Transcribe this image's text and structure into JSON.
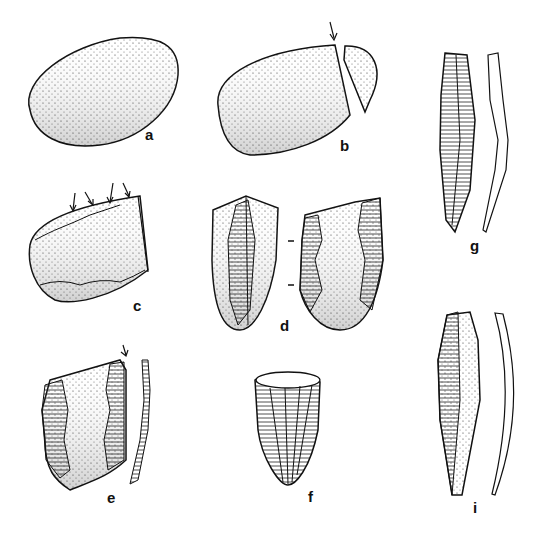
{
  "figure": {
    "items": [
      {
        "id": "a",
        "label": "a",
        "description": "ovoid pebble / nodule"
      },
      {
        "id": "b",
        "label": "b",
        "description": "nodule with struck-off end, arrow marking blow"
      },
      {
        "id": "c",
        "label": "c",
        "description": "core with retouched edge, four arrows"
      },
      {
        "id": "d",
        "label": "d",
        "description": "two views of a bifacially flaked piece"
      },
      {
        "id": "e",
        "label": "e",
        "description": "retouched piece with side profile and arrow"
      },
      {
        "id": "f",
        "label": "f",
        "description": "conical fluted core"
      },
      {
        "id": "g",
        "label": "g",
        "description": "retouched point with profile"
      },
      {
        "id": "i",
        "label": "i",
        "description": "blade with curved profile"
      }
    ],
    "colors": {
      "ink": "#111111",
      "background": "#ffffff"
    }
  }
}
